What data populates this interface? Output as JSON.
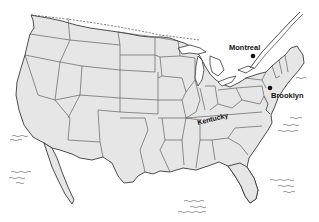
{
  "map": {
    "title": "",
    "colors": {
      "land": "#e6e6e6",
      "border": "#3a3a3a",
      "water": "#ffffff",
      "label": "#111111",
      "marker": "#111111"
    },
    "labels": [
      {
        "id": "montreal",
        "text": "Montreal",
        "type": "city",
        "marker": "dot"
      },
      {
        "id": "brooklyn",
        "text": "Brooklyn",
        "type": "city",
        "marker": "dot"
      },
      {
        "id": "kentucky",
        "text": "Kentucky",
        "type": "state",
        "marker": "none"
      }
    ],
    "symbols": [
      {
        "name": "ocean-waves-pacific-1"
      },
      {
        "name": "ocean-waves-pacific-2"
      },
      {
        "name": "ocean-waves-atlantic-1"
      },
      {
        "name": "ocean-waves-atlantic-2"
      },
      {
        "name": "ocean-waves-gulf"
      }
    ]
  }
}
